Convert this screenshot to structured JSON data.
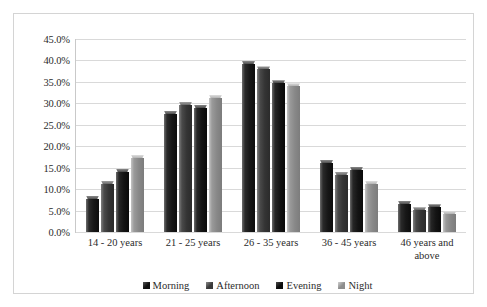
{
  "chart_data": {
    "type": "bar",
    "title": "",
    "subtitle": "",
    "xlabel": "",
    "ylabel": "",
    "ylim": [
      0,
      45
    ],
    "ytick_labels": [
      "45.0%",
      "40.0%",
      "35.0%",
      "30.0%",
      "25.0%",
      "20.0%",
      "15.0%",
      "10.0%",
      "5.0%",
      "0.0%"
    ],
    "ytick_values": [
      45,
      40,
      35,
      30,
      25,
      20,
      15,
      10,
      5,
      0
    ],
    "grid": true,
    "legend_position": "bottom",
    "categories": [
      "14 - 20 years",
      "21 - 25 years",
      "26 - 35 years",
      "36 - 45 years",
      "46 years and above"
    ],
    "series": [
      {
        "name": "Morning",
        "color": "#141414",
        "values": [
          8.5,
          28.3,
          39.9,
          16.8,
          7.3
        ]
      },
      {
        "name": "Afternoon",
        "color": "#343434",
        "values": [
          12.0,
          30.4,
          38.6,
          14.0,
          5.8
        ]
      },
      {
        "name": "Evening",
        "color": "#0f0f0f",
        "values": [
          14.8,
          29.7,
          35.4,
          15.2,
          6.5
        ]
      },
      {
        "name": "Night",
        "color": "#8a8a8a",
        "values": [
          18.0,
          32.0,
          34.7,
          12.0,
          4.8
        ]
      }
    ]
  }
}
